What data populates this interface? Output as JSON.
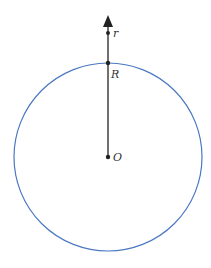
{
  "diagram": {
    "title": "",
    "circle": {
      "cx": 108,
      "cy": 157,
      "r": 94,
      "stroke": "#4a78c2"
    },
    "radial_line": {
      "x": 108,
      "y_top": 17,
      "y_bottom": 157,
      "stroke": "#333333"
    },
    "points": [
      {
        "id": "O",
        "label": "O",
        "x": 108,
        "y": 157
      },
      {
        "id": "R",
        "label": "R",
        "x": 108,
        "y": 63
      },
      {
        "id": "r",
        "label": "r",
        "x": 108,
        "y": 33
      }
    ],
    "labels": {
      "O": "O",
      "R": "R",
      "r": "r"
    }
  }
}
